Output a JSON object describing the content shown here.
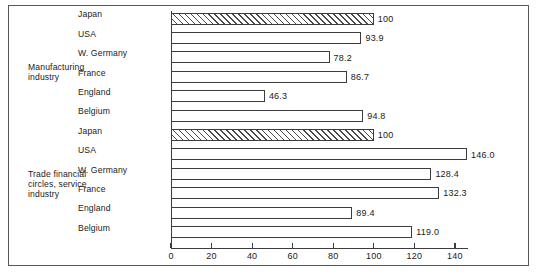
{
  "chart_data": {
    "type": "bar",
    "orientation": "horizontal",
    "title": "",
    "xlabel": "",
    "ylabel": "",
    "xlim": [
      0,
      150
    ],
    "xticks": [
      0,
      20,
      40,
      60,
      80,
      100,
      120,
      140
    ],
    "xtick_labels": [
      "0",
      "20",
      "40",
      "60",
      "80",
      "100",
      "120",
      "140"
    ],
    "grid": false,
    "legend": "none",
    "groups": [
      {
        "label": "Manufacturing\nindustry",
        "categories": [
          "Japan",
          "USA",
          "W. Germany",
          "France",
          "England",
          "Belgium"
        ],
        "values": [
          100,
          93.9,
          78.2,
          86.7,
          46.3,
          94.8
        ],
        "value_labels": [
          "100",
          "93.9",
          "78.2",
          "86.7",
          "46.3",
          "94.8"
        ],
        "hatched": [
          true,
          false,
          false,
          false,
          false,
          false
        ]
      },
      {
        "label": "Trade financial\ncircles, service\nindustry",
        "categories": [
          "Japan",
          "USA",
          "W. Germany",
          "France",
          "England",
          "Belgium"
        ],
        "values": [
          100,
          146.0,
          128.4,
          132.3,
          89.4,
          119.0
        ],
        "value_labels": [
          "100",
          "146.0",
          "128.4",
          "132.3",
          "89.4",
          "119.0"
        ],
        "hatched": [
          true,
          false,
          false,
          false,
          false,
          false
        ]
      }
    ]
  },
  "colors": {
    "frame": "#58585a",
    "axis": "#3c3c3e",
    "bar_edge": "#3c3c3e",
    "bar_fill": "#ffffff",
    "hatch": "#4a4a4c",
    "text": "#1a1a1a",
    "background": "#ffffff"
  }
}
